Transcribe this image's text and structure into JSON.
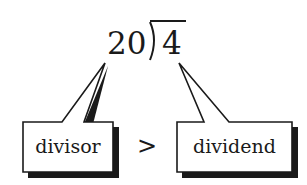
{
  "division": {
    "divisor": "20",
    "dividend": "4"
  },
  "labels": {
    "divisor": "divisor",
    "comparison": ">",
    "dividend": "dividend"
  },
  "colors": {
    "ink": "#1a1a1a",
    "background": "#ffffff"
  }
}
